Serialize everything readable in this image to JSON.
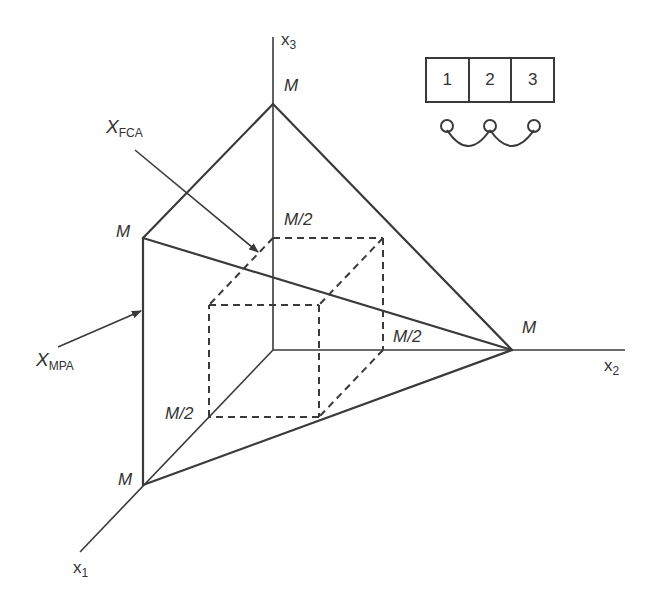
{
  "figure": {
    "axes": {
      "x1": {
        "name": "x",
        "sub": "1"
      },
      "x2": {
        "name": "x",
        "sub": "2"
      },
      "x3": {
        "name": "x",
        "sub": "3"
      }
    },
    "vertex_labels": {
      "x3_M": "M",
      "x2_M": "M",
      "x1_M": "M",
      "corner_M": "M",
      "x3_half": "M/2",
      "x2_half": "M/2",
      "x1_half": "M/2"
    },
    "annotations": {
      "fca": {
        "main": "X",
        "sub": "FCA"
      },
      "mpa": {
        "main": "X",
        "sub": "MPA"
      }
    },
    "legend": {
      "cells": [
        "1",
        "2",
        "3"
      ],
      "connections": "1-2, 2-3 (linked nodes)"
    }
  }
}
